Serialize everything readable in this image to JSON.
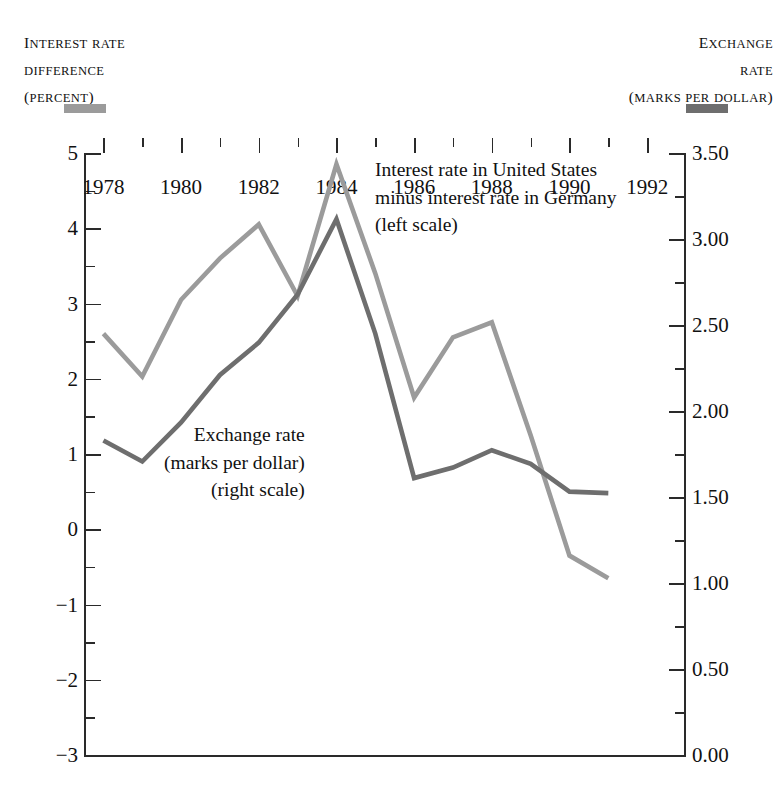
{
  "left_axis_caption": {
    "line1": "Interest rate",
    "line2": "difference",
    "line3": "(percent)",
    "swatch_color": "#9b9b9b"
  },
  "right_axis_caption": {
    "line1": "Exchange",
    "line2": "rate",
    "line3": "(marks per dollar)",
    "swatch_color": "#6e6e6e"
  },
  "annotations": {
    "interest": {
      "line1": "Interest rate in United States",
      "line2": "minus interest rate in Germany",
      "line3": "(left scale)"
    },
    "exchange": {
      "line1": "Exchange rate",
      "line2": "(marks per dollar)",
      "line3": "(right scale)"
    }
  },
  "chart_data": {
    "type": "line",
    "title": "",
    "xlabel": "",
    "ylabel": "Interest rate difference (percent)",
    "y2label": "Exchange rate (marks per dollar)",
    "grid": false,
    "legend": "inline-annotations",
    "x": [
      1978,
      1979,
      1980,
      1981,
      1982,
      1983,
      1984,
      1985,
      1986,
      1987,
      1988,
      1989,
      1990,
      1991
    ],
    "xlim": [
      1977.5,
      1993.0
    ],
    "xticks_major": [
      1978,
      1980,
      1982,
      1984,
      1986,
      1988,
      1990,
      1992
    ],
    "xticks_minor": [
      1979,
      1981,
      1983,
      1985,
      1987,
      1989,
      1991
    ],
    "ylim": [
      -3,
      5
    ],
    "yticks_major": [
      5,
      4,
      3,
      2,
      1,
      0,
      -1,
      -2,
      -3
    ],
    "yticks_major_labels": [
      "5",
      "4",
      "3",
      "2",
      "1",
      "0",
      "−1",
      "−2",
      "−3"
    ],
    "yticks_minor": [
      4.5,
      3.5,
      2.5,
      1.5,
      0.5,
      -0.5,
      -1.5,
      -2.5
    ],
    "y2lim": [
      0.0,
      3.5
    ],
    "y2ticks_major": [
      3.5,
      3.0,
      2.5,
      2.0,
      1.5,
      1.0,
      0.5,
      0.0
    ],
    "y2ticks_major_labels": [
      "3.50",
      "3.00",
      "2.50",
      "2.00",
      "1.50",
      "1.00",
      "0.50",
      "0.00"
    ],
    "y2ticks_minor": [
      3.25,
      2.75,
      2.25,
      1.75,
      1.25,
      0.75,
      0.25
    ],
    "series": [
      {
        "name": "Interest rate in United States minus interest rate in Germany (left scale)",
        "axis": "left",
        "color": "#9b9b9b",
        "values": [
          2.6,
          2.03,
          3.05,
          3.6,
          4.05,
          3.1,
          4.85,
          3.4,
          1.75,
          2.55,
          2.75,
          1.25,
          -0.35,
          -0.65
        ]
      },
      {
        "name": "Exchange rate (marks per dollar) (right scale)",
        "axis": "right",
        "color": "#6e6e6e",
        "values_left_scale": [
          1.18,
          0.9,
          1.42,
          2.05,
          2.48,
          3.12,
          4.12,
          2.6,
          0.68,
          0.82,
          1.05,
          0.87,
          0.5,
          0.48
        ],
        "values": [
          1.83,
          1.71,
          1.66,
          1.9,
          2.06,
          2.3,
          2.67,
          2.1,
          1.54,
          1.59,
          1.67,
          1.6,
          1.47,
          1.47
        ]
      }
    ]
  }
}
